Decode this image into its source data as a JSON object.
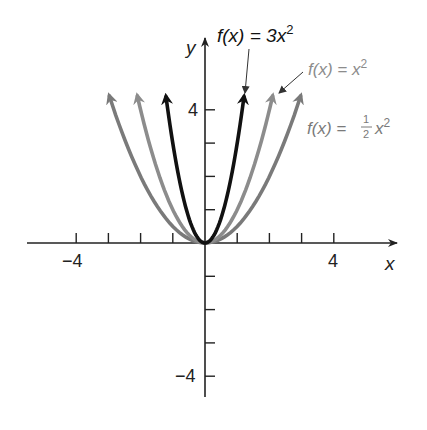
{
  "chart_data": {
    "type": "line",
    "title": "",
    "xlabel": "x",
    "ylabel": "y",
    "xlim": [
      -5.5,
      5.5
    ],
    "ylim": [
      -4.7,
      4.4
    ],
    "x_ticks": [
      -6,
      -5,
      -4,
      -3,
      -2,
      -1,
      1,
      2,
      3,
      4
    ],
    "x_tick_labels": [
      {
        "value": -4,
        "label": "−4"
      },
      {
        "value": 4,
        "label": "4"
      }
    ],
    "y_tick_labels": [
      {
        "value": 4,
        "label": "4"
      },
      {
        "value": -4,
        "label": "−4"
      }
    ],
    "grid": false,
    "series": [
      {
        "name": "f(x) = 3x^2",
        "label_text": "f(x) = 3x",
        "exp": "2",
        "coef": 3,
        "color": "#111111",
        "x_range": [
          -1.21,
          1.21
        ]
      },
      {
        "name": "f(x) = x^2",
        "label_text": "f(x) = x",
        "exp": "2",
        "coef": 1,
        "color": "#8c8c8c",
        "x_range": [
          -2.1,
          2.1
        ]
      },
      {
        "name": "f(x) = 1/2 x^2",
        "label_text": "f(x) = ",
        "frac_num": "1",
        "frac_den": "2",
        "exp": "2",
        "coef": 0.5,
        "color": "#7a7a7a",
        "x_range": [
          -2.97,
          2.97
        ]
      }
    ]
  },
  "labels": {
    "x_axis": "x",
    "y_axis": "y",
    "x_neg4": "−4",
    "x_pos4": "4",
    "y_pos4": "4",
    "y_neg4": "−4",
    "f3_main": "f(x) = 3x",
    "f3_exp": "2",
    "f1_main": "f(x) = x",
    "f1_exp": "2",
    "fh_main": "f(x) = ",
    "fh_num": "1",
    "fh_den": "2",
    "fh_x": "x",
    "fh_exp": "2"
  }
}
